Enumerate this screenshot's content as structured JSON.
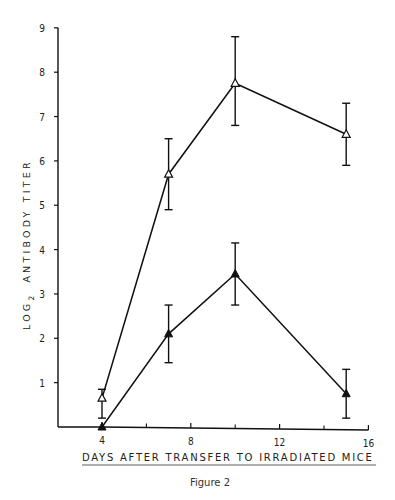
{
  "caption": "Figure 2",
  "chart_data": {
    "type": "line",
    "title": "",
    "caption": "Figure 2",
    "xlabel": "DAYS AFTER TRANSFER TO IRRADIATED MICE",
    "ylabel": "LOG2 ANTIBODY TITER",
    "ylabel_parts": {
      "pre": "LOG",
      "sub": "2",
      "post": "ANTIBODY TITER"
    },
    "xlim": [
      2,
      16
    ],
    "ylim": [
      0,
      9
    ],
    "x_ticks": [
      4,
      8,
      12,
      16
    ],
    "x_minor_ticks": [
      6,
      10,
      14
    ],
    "y_ticks": [
      1,
      2,
      3,
      4,
      5,
      6,
      7,
      8,
      9
    ],
    "grid": false,
    "legend": null,
    "series": [
      {
        "name": "open-triangle",
        "marker": "open triangle",
        "x": [
          4,
          7,
          10,
          15
        ],
        "values": [
          0.65,
          5.7,
          7.75,
          6.6
        ],
        "error_low": [
          0.2,
          4.9,
          6.8,
          5.9
        ],
        "error_high": [
          0.85,
          6.5,
          8.8,
          7.3
        ]
      },
      {
        "name": "filled-triangle",
        "marker": "filled triangle",
        "x": [
          4,
          7,
          10,
          15
        ],
        "values": [
          0.0,
          2.1,
          3.45,
          0.75
        ],
        "error_low": [
          0.0,
          1.45,
          2.75,
          0.2
        ],
        "error_high": [
          0.0,
          2.75,
          4.15,
          1.3
        ]
      }
    ]
  }
}
